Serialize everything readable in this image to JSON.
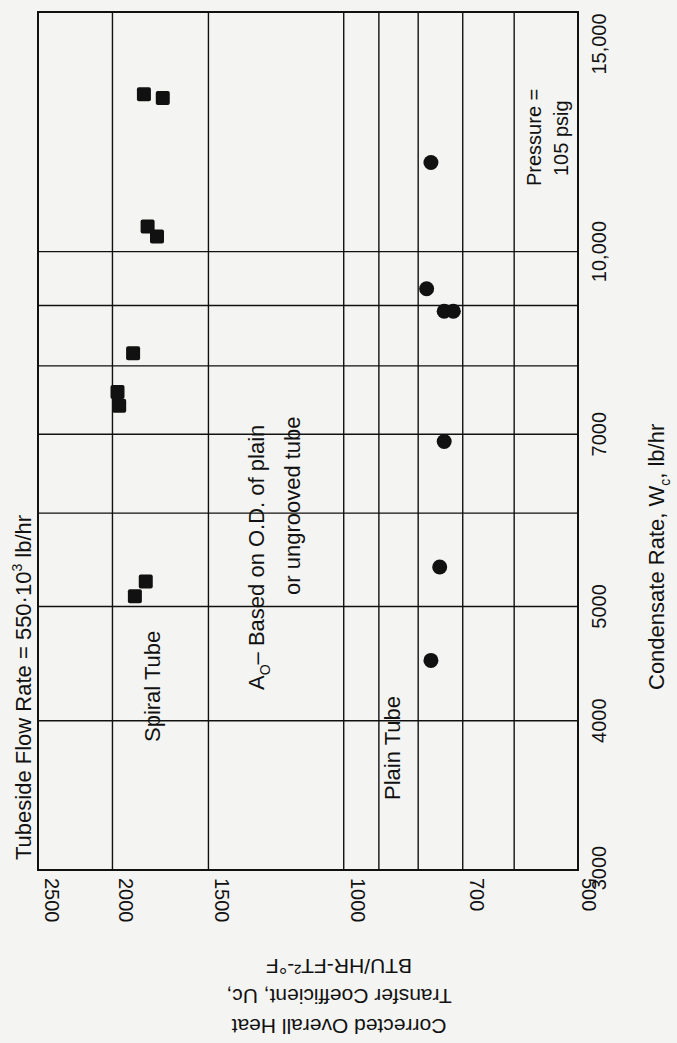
{
  "chart_data": {
    "type": "scatter",
    "title_parts": {
      "main": "Tubeside  Flow  Rate = 550·10",
      "sup": "3",
      "tail": " lb/hr"
    },
    "xlabel": "Condensate Rate, Wc, lb/hr",
    "xlabel_parts": {
      "main": "Condensate  Rate, W",
      "sub": "c",
      "tail": ",  lb/hr"
    },
    "ylabel_line1": "Corrected Overall Heat",
    "ylabel_line2": "Transfer Coefficient, Uc,",
    "ylabel_line3": "BTU/HR-FT²-°F",
    "x_scale": "log",
    "y_scale": "log",
    "xlim": [
      3000,
      15000
    ],
    "ylim": [
      500,
      2500
    ],
    "x_ticks": [
      {
        "value": 3000,
        "label": "3000"
      },
      {
        "value": 4000,
        "label": "4000"
      },
      {
        "value": 5000,
        "label": "5000"
      },
      {
        "value": 7000,
        "label": "7000"
      },
      {
        "value": 10000,
        "label": "10,000"
      },
      {
        "value": 15000,
        "label": "15,000"
      }
    ],
    "y_ticks": [
      {
        "value": 2500,
        "label": "2500"
      },
      {
        "value": 2000,
        "label": "2000"
      },
      {
        "value": 1500,
        "label": "1500"
      },
      {
        "value": 1000,
        "label": "1000"
      },
      {
        "value": 700,
        "label": "700"
      },
      {
        "value": 500,
        "label": "500"
      }
    ],
    "grid": true,
    "orientation": "rotated 90° counter-clockwise (x-axis on right edge, y-axis on bottom edge)",
    "series": [
      {
        "name": "Spiral Tube",
        "marker": "square",
        "points": [
          {
            "x": 5100,
            "y": 1870
          },
          {
            "x": 5250,
            "y": 1810
          },
          {
            "x": 7400,
            "y": 1960
          },
          {
            "x": 7600,
            "y": 1970
          },
          {
            "x": 8200,
            "y": 1880
          },
          {
            "x": 10300,
            "y": 1750
          },
          {
            "x": 10500,
            "y": 1800
          },
          {
            "x": 13500,
            "y": 1720
          },
          {
            "x": 13600,
            "y": 1820
          }
        ]
      },
      {
        "name": "Plain Tube",
        "marker": "circle",
        "points": [
          {
            "x": 4500,
            "y": 770
          },
          {
            "x": 5400,
            "y": 750
          },
          {
            "x": 6900,
            "y": 740
          },
          {
            "x": 8900,
            "y": 720
          },
          {
            "x": 8900,
            "y": 740
          },
          {
            "x": 9300,
            "y": 780
          },
          {
            "x": 11900,
            "y": 770
          }
        ]
      }
    ],
    "annotations": [
      {
        "text": "Spiral Tube"
      },
      {
        "text": "Plain Tube"
      },
      {
        "text": "Ao – Based on O.D. of plain",
        "line2": "or ungrooved tube"
      },
      {
        "text": "Pressure =",
        "line2": "105 psig"
      }
    ]
  },
  "labels": {
    "spiral": "Spiral  Tube",
    "plain": "Plain  Tube",
    "note_a": "A",
    "note_sub": "O",
    "note_line1": "– Based  on  O.D.  of  plain",
    "note_line2": "or  ungrooved  tube",
    "pressure_line1": "Pressure =",
    "pressure_line2": "105  psig"
  }
}
